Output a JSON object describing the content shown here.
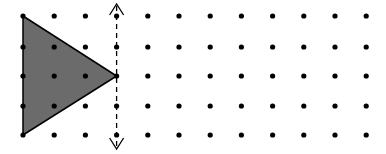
{
  "diagram": {
    "grid": {
      "columns": 12,
      "rows": 5,
      "x_start": 23,
      "x_spacing": 31.2,
      "y_positions": [
        16,
        47,
        76,
        106,
        135
      ],
      "dot_radius": 2.6,
      "dot_color": "#000000"
    },
    "triangle": {
      "vertices_grid": [
        [
          0,
          0
        ],
        [
          0,
          4
        ],
        [
          3,
          2
        ]
      ],
      "fill_color": "#6b6b6b",
      "stroke_color": "#000000"
    },
    "reflection_line": {
      "type": "vertical dashed line with arrows at both ends",
      "grid_column": 3,
      "y_top": 4,
      "y_bottom": 149,
      "color": "#000000",
      "dash": "5,4"
    }
  }
}
